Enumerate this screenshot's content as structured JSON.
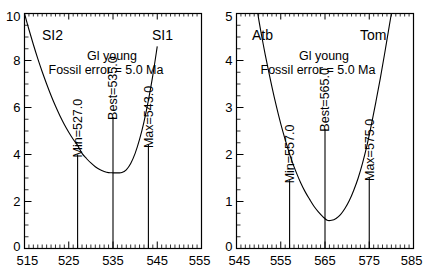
{
  "figure": {
    "panel_count": 2,
    "background": "#ffffff",
    "line_color": "#000000"
  },
  "chart_data": [
    {
      "type": "line",
      "panel": "left",
      "title": "",
      "xlabel": "",
      "ylabel": "",
      "xlim": [
        515,
        555
      ],
      "ylim": [
        0,
        10
      ],
      "xticks": [
        515,
        525,
        535,
        545,
        555
      ],
      "xticklabels": [
        "515",
        "525",
        "535",
        "545",
        "555"
      ],
      "yticks": [
        0,
        2,
        4,
        6,
        8,
        10
      ],
      "yticklabels": [
        "0",
        "2",
        "4",
        "6",
        "8",
        "10"
      ],
      "x_minor_step": 1,
      "y_minor_step": 0.5,
      "grid": false,
      "legend": "none",
      "annotations": {
        "left_endpoint": "SI2",
        "right_endpoint": "SI1",
        "line1": "Gl young",
        "line2": "Fossil error = 5.0 Ma"
      },
      "markers": [
        {
          "label": "Min=527.0",
          "x": 527.0,
          "y_top": 4.0
        },
        {
          "label": "Best=535.0",
          "x": 535.0,
          "y_top": 5.6
        },
        {
          "label": "Max=543.0",
          "x": 543.0,
          "y_top": 4.4
        }
      ],
      "curve": {
        "vertex_x": 536.8,
        "vertex_y": 3.22,
        "points_x": [
          515.0,
          516.0,
          517.0,
          518.0,
          519.0,
          520.0,
          521.0,
          522.0,
          523.0,
          524.0,
          525.0,
          526.0,
          527.0,
          528.0,
          529.0,
          530.0,
          531.0,
          532.0,
          533.0,
          534.0,
          535.0,
          536.0,
          537.0,
          538.0,
          539.0,
          540.0,
          541.0,
          542.0,
          543.0,
          544.0,
          545.0
        ],
        "points_y": [
          10.0,
          9.32,
          8.68,
          8.08,
          7.52,
          7.0,
          6.51,
          6.06,
          5.65,
          5.28,
          4.95,
          4.65,
          4.39,
          4.05,
          3.83,
          3.64,
          3.48,
          3.36,
          3.28,
          3.23,
          3.22,
          3.22,
          3.23,
          3.35,
          3.62,
          4.05,
          4.64,
          5.39,
          6.3,
          7.37,
          8.6
        ]
      }
    },
    {
      "type": "line",
      "panel": "right",
      "title": "",
      "xlabel": "",
      "ylabel": "",
      "xlim": [
        545,
        585
      ],
      "ylim": [
        0,
        5
      ],
      "xticks": [
        545,
        555,
        565,
        575,
        585
      ],
      "xticklabels": [
        "545",
        "555",
        "565",
        "575",
        "585"
      ],
      "yticks": [
        0,
        1,
        2,
        3,
        4,
        5
      ],
      "yticklabels": [
        "0",
        "1",
        "2",
        "3",
        "4",
        "5"
      ],
      "x_minor_step": 1,
      "y_minor_step": 0.25,
      "grid": false,
      "legend": "none",
      "annotations": {
        "left_endpoint": "Atb",
        "right_endpoint": "Tom",
        "line1": "Gl young",
        "line2": "Fossil error = 5.0 Ma"
      },
      "markers": [
        {
          "label": "Min=557.0",
          "x": 557.0,
          "y_top": 1.45
        },
        {
          "label": "Best=565.0",
          "x": 565.0,
          "y_top": 2.55
        },
        {
          "label": "Max=575.0",
          "x": 575.0,
          "y_top": 1.5
        }
      ],
      "curve": {
        "vertex_x": 565.5,
        "vertex_y": 0.6,
        "points_x": [
          549.8,
          550.5,
          551.5,
          552.5,
          553.5,
          554.5,
          555.5,
          556.5,
          557.5,
          558.5,
          559.5,
          560.5,
          561.5,
          562.5,
          563.5,
          564.5,
          565.5,
          566.5,
          567.5,
          568.5,
          569.5,
          570.5,
          571.5,
          572.5,
          573.5,
          574.5,
          575.5,
          576.5,
          577.5,
          578.5,
          579.5,
          580.0
        ],
        "points_y": [
          5.0,
          4.62,
          4.12,
          3.66,
          3.23,
          2.84,
          2.48,
          2.16,
          1.87,
          1.62,
          1.4,
          1.21,
          1.05,
          0.9,
          0.78,
          0.68,
          0.6,
          0.6,
          0.64,
          0.72,
          0.85,
          1.02,
          1.24,
          1.5,
          1.82,
          2.2,
          2.64,
          3.12,
          3.62,
          4.16,
          4.72,
          5.0
        ]
      }
    }
  ]
}
